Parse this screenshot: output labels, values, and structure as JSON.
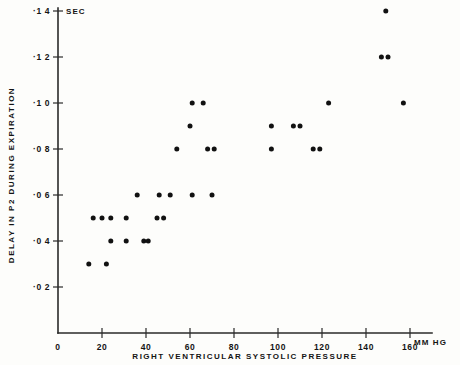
{
  "chart_data": {
    "type": "scatter",
    "title": "",
    "xlabel": "RIGHT VENTRICULAR SYSTOLIC PRESSURE",
    "ylabel": "DELAY IN P2 DURING EXPIRATION",
    "x_unit": "MM HG",
    "y_unit": "SEC",
    "xlim": [
      0,
      168
    ],
    "ylim": [
      0,
      0.146
    ],
    "grid": false,
    "legend": null,
    "x_ticks": [
      0,
      20,
      40,
      60,
      80,
      100,
      120,
      140,
      160
    ],
    "x_tick_labels": [
      "0",
      "20",
      "40",
      "60",
      "80",
      "100",
      "120",
      "140",
      "160"
    ],
    "y_ticks": [
      0.02,
      0.04,
      0.06,
      0.08,
      0.1,
      0.12,
      0.14
    ],
    "y_tick_labels": [
      "·0 2",
      "·0 4",
      "·0 6",
      "·0 8",
      "·1 0",
      "·1 2",
      "·1 4"
    ],
    "points": [
      {
        "x": 14,
        "y": 0.03
      },
      {
        "x": 22,
        "y": 0.03
      },
      {
        "x": 16,
        "y": 0.05
      },
      {
        "x": 20,
        "y": 0.05
      },
      {
        "x": 24,
        "y": 0.05
      },
      {
        "x": 31,
        "y": 0.05
      },
      {
        "x": 24,
        "y": 0.04
      },
      {
        "x": 31,
        "y": 0.04
      },
      {
        "x": 39,
        "y": 0.04
      },
      {
        "x": 41,
        "y": 0.04
      },
      {
        "x": 45,
        "y": 0.05
      },
      {
        "x": 48,
        "y": 0.05
      },
      {
        "x": 36,
        "y": 0.06
      },
      {
        "x": 46,
        "y": 0.06
      },
      {
        "x": 51,
        "y": 0.06
      },
      {
        "x": 61,
        "y": 0.06
      },
      {
        "x": 70,
        "y": 0.06
      },
      {
        "x": 54,
        "y": 0.08
      },
      {
        "x": 68,
        "y": 0.08
      },
      {
        "x": 71,
        "y": 0.08
      },
      {
        "x": 97,
        "y": 0.08
      },
      {
        "x": 116,
        "y": 0.08
      },
      {
        "x": 119,
        "y": 0.08
      },
      {
        "x": 60,
        "y": 0.09
      },
      {
        "x": 97,
        "y": 0.09
      },
      {
        "x": 107,
        "y": 0.09
      },
      {
        "x": 110,
        "y": 0.09
      },
      {
        "x": 61,
        "y": 0.1
      },
      {
        "x": 66,
        "y": 0.1
      },
      {
        "x": 123,
        "y": 0.1
      },
      {
        "x": 157,
        "y": 0.1
      },
      {
        "x": 147,
        "y": 0.12
      },
      {
        "x": 150,
        "y": 0.12
      },
      {
        "x": 149,
        "y": 0.14
      }
    ]
  },
  "axes": {
    "y_unit_label": "SEC",
    "x_unit_label": "MM HG",
    "y_axis_title": "DELAY IN P2 DURING EXPIRATION",
    "x_axis_title": "RIGHT VENTRICULAR SYSTOLIC PRESSURE"
  }
}
